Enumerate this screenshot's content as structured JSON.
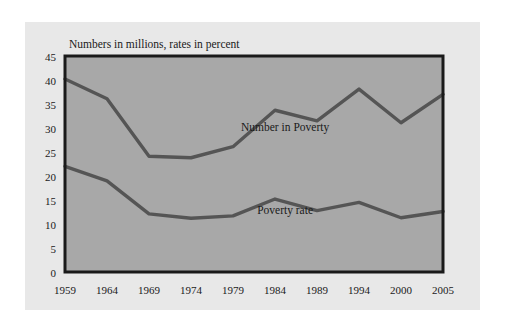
{
  "figure": {
    "background_color": "#ffffff",
    "panel_color": "#e8e8e8",
    "plot_background_color": "#a8a8a8",
    "gridline_color": "#ffffff",
    "frame_color": "#1a1a1a",
    "line_color": "#555555",
    "text_color": "#1a1a1a"
  },
  "chart_data": {
    "type": "line",
    "title": "Numbers in millions, rates in percent",
    "xlabel": "",
    "ylabel": "",
    "ylim": [
      0,
      45
    ],
    "yticks": [
      0,
      5,
      10,
      15,
      20,
      25,
      30,
      35,
      40,
      45
    ],
    "ytick_labels": [
      "0",
      "5",
      "10",
      "15",
      "20",
      "25",
      "30",
      "35",
      "40",
      "45"
    ],
    "grid": true,
    "legend_position": "inline-annotation",
    "categories": [
      "1959",
      "1964",
      "1969",
      "1974",
      "1979",
      "1984",
      "1989",
      "1994",
      "2000",
      "2005"
    ],
    "x": [
      1959,
      1964,
      1969,
      1974,
      1979,
      1984,
      1989,
      1994,
      2000,
      2005
    ],
    "series": [
      {
        "name": "Number in Poverty",
        "units": "millions",
        "values": [
          40.2,
          36.1,
          24.1,
          23.8,
          26.1,
          33.7,
          31.5,
          38.1,
          31.1,
          37.0
        ],
        "annotation": "Number in Poverty",
        "annotation_x": 1985.2,
        "annotation_y": 29.3
      },
      {
        "name": "Poverty rate",
        "units": "percent",
        "values": [
          22.0,
          19.0,
          12.1,
          11.2,
          11.7,
          15.2,
          12.8,
          14.5,
          11.3,
          12.6
        ],
        "annotation": "Poverty rate",
        "annotation_x": 1985.2,
        "annotation_y": 12.1
      }
    ]
  }
}
